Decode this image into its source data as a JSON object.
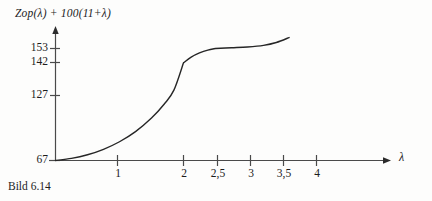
{
  "figure": {
    "caption": "Bild 6.14",
    "axis_title": {
      "prefix_italic": "Zop(λ)",
      "middle": " + 100(11+",
      "suffix_italic": "λ",
      "close": ")",
      "full": "Zop(λ) + 100(11+λ)"
    },
    "x_axis_symbol": "λ",
    "colors": {
      "background": "#fdfdfc",
      "axis": "#4a4a4a",
      "curve": "#262626",
      "text": "#1c1c1c"
    }
  },
  "chart_data": {
    "type": "line",
    "title": "Zop(λ) + 100(11+λ)",
    "xlabel": "λ",
    "ylabel": "Zop(λ) + 100(11+λ)",
    "grid": false,
    "legend": null,
    "xlim": [
      0,
      4.6
    ],
    "ylim": [
      67,
      165
    ],
    "xticks": [
      1,
      2,
      2.5,
      3,
      3.5,
      4
    ],
    "xticklabels": [
      "1",
      "2",
      "2,5",
      "3",
      "3,5",
      "4"
    ],
    "yticks": [
      67,
      127,
      142,
      153
    ],
    "yticklabels": [
      "67",
      "127",
      "142",
      "153"
    ],
    "breakpoints": [
      2,
      2.5
    ],
    "series": [
      {
        "name": "Zop",
        "x": [
          0.0,
          0.25,
          0.5,
          0.75,
          1.0,
          1.25,
          1.5,
          1.7,
          1.85,
          2.0,
          2.0,
          2.12,
          2.25,
          2.38,
          2.5,
          2.5,
          2.75,
          3.0,
          3.25,
          3.45,
          3.65
        ],
        "y": [
          67.0,
          68.6,
          71.4,
          75.6,
          81.4,
          89.2,
          99.6,
          110.4,
          121.0,
          142.0,
          142.0,
          146.4,
          149.6,
          151.8,
          153.0,
          153.0,
          153.6,
          154.2,
          155.4,
          157.6,
          161.4
        ]
      }
    ]
  }
}
